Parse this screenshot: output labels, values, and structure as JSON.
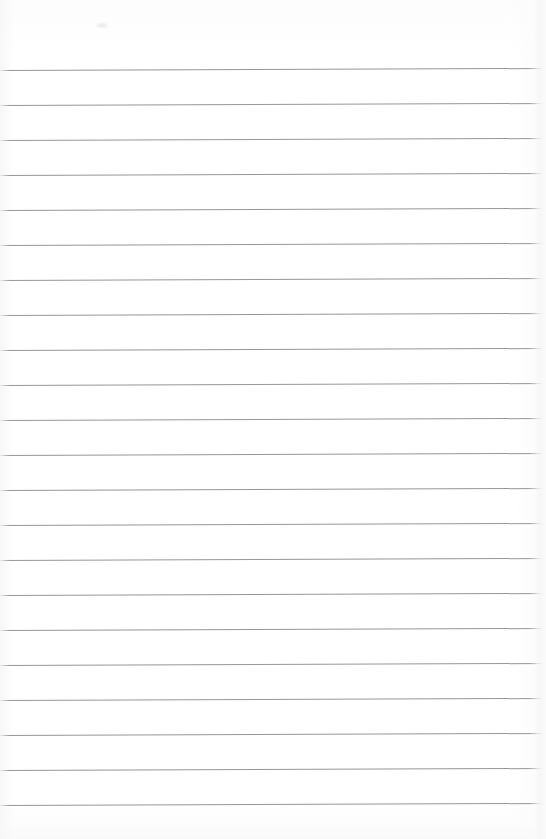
{
  "document": {
    "kind": "scanned-lined-notebook-page",
    "title": "Blank Ruled Page",
    "page_width": 546,
    "page_height": 839,
    "background_color": "#ffffff",
    "has_text_content": false,
    "visible_text": "",
    "orientation": "portrait"
  },
  "ruling": {
    "type": "horizontal-ruled-lines",
    "line_color": "#8d8d92",
    "line_thickness_px": 1,
    "line_spacing_px": 35,
    "first_line_y": 70,
    "last_line_y": 805,
    "line_count": 22,
    "left_x": 0,
    "right_x": 542,
    "slope_rise_px": -2,
    "top_margin_px": 70,
    "bottom_margin_px": 34,
    "right_margin_px": 4,
    "line_y_positions": [
      70,
      105,
      140,
      175,
      210,
      245,
      280,
      315,
      350,
      385,
      420,
      455,
      490,
      525,
      560,
      595,
      630,
      665,
      700,
      735,
      770,
      805
    ]
  },
  "artifacts": {
    "smudge": {
      "name": "faint-smudge",
      "x": 95,
      "y": 22,
      "width": 14,
      "height": 7,
      "color": "#e2e2e5"
    },
    "right_edge_shadow": {
      "name": "page-edge-shadow",
      "x": 534,
      "width": 12,
      "color": "#f3f3f5"
    },
    "bottom_edge_shadow": {
      "name": "page-bottom-shadow",
      "y": 823,
      "height": 16,
      "color": "#f8f8f9"
    }
  }
}
